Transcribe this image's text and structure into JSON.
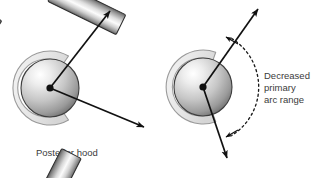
{
  "figure": {
    "background_color": "#ffffff",
    "width": 325,
    "height": 178,
    "text_color": "#3b3b3b",
    "outline_color": "#1a1a1a",
    "hood_fill_color": "#e8e8e8",
    "hood_stroke_color": "#9a9a9a",
    "sphere_light_color": "#fdfdfd",
    "sphere_mid_color": "#c8c8c8",
    "sphere_dark_color": "#6e6e6e",
    "arm_light_color": "#fafafa",
    "arm_mid_color": "#c0c0c0",
    "arm_dark_color": "#555555"
  },
  "left_panel": {
    "name": "normal-arc-panel",
    "caption": "Posterior hood",
    "center_point": {
      "x": 50,
      "y": 88
    },
    "sphere_radius": 29,
    "hood": {
      "label": "posterior-hood-arc",
      "outer_radius": 37,
      "inner_radius": 29,
      "start_angle_deg": 300,
      "end_angle_deg": 60
    },
    "arms": [
      {
        "label": "upper-arm",
        "angle_deg": -57,
        "length": 68,
        "width": 22
      },
      {
        "label": "lower-arm",
        "angle_deg": 26,
        "length": 72,
        "width": 22
      }
    ],
    "arrows": [
      {
        "label": "upper-motion-arrow",
        "from": {
          "x": 50,
          "y": 88
        },
        "to": {
          "x": 112,
          "y": 9
        }
      },
      {
        "label": "lower-motion-arrow",
        "from": {
          "x": 50,
          "y": 88
        },
        "to": {
          "x": 147,
          "y": 129
        }
      }
    ]
  },
  "right_panel": {
    "name": "decreased-arc-panel",
    "center_point": {
      "x": 203,
      "y": 87
    },
    "sphere_radius": 29,
    "hood": {
      "label": "posterior-hood-arc",
      "outer_radius": 37,
      "inner_radius": 29,
      "start_angle_deg": 290,
      "end_angle_deg": 70
    },
    "arms": [
      {
        "label": "upper-arm",
        "angle_deg": -63,
        "length": 72,
        "width": 22
      },
      {
        "label": "lower-arm",
        "angle_deg": 70,
        "length": 72,
        "width": 22
      }
    ],
    "arrows": [
      {
        "label": "upper-motion-arrow",
        "from": {
          "x": 203,
          "y": 87
        },
        "to": {
          "x": 260,
          "y": 7
        }
      },
      {
        "label": "lower-motion-arrow",
        "from": {
          "x": 203,
          "y": 87
        },
        "to": {
          "x": 228,
          "y": 160
        }
      }
    ],
    "arc_annotation": {
      "label": "decreased-primary-arc-range",
      "line1": "Decreased",
      "line2": "primary",
      "line3": "arc range",
      "dashed_arc_radius": 57,
      "dash_pattern": "2,3"
    }
  }
}
